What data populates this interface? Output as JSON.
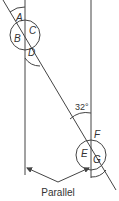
{
  "diagram": {
    "type": "parallel-lines-transversal",
    "angle_labels": {
      "A": "A",
      "B": "B",
      "C": "C",
      "D": "D",
      "E": "E",
      "F": "F",
      "G": "G"
    },
    "given_angle": "32°",
    "caption": "Parallel",
    "line_color": "#444444"
  }
}
